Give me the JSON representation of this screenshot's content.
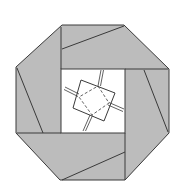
{
  "diagram": {
    "type": "origami-fold-diagram",
    "colors": {
      "paper_fill": "#bcbcbc",
      "line": "#3a3a3a",
      "background": "#ffffff"
    },
    "outline_octagon": [
      [
        62,
        25
      ],
      [
        124,
        25
      ],
      [
        169,
        69
      ],
      [
        169,
        133
      ],
      [
        125,
        180
      ],
      [
        60,
        180
      ],
      [
        16,
        133
      ],
      [
        16,
        67
      ]
    ],
    "inner_window": {
      "x": 61,
      "y": 69,
      "w": 64,
      "h": 64
    },
    "flap_lines": [
      {
        "name": "top-flap-edge",
        "points": [
          [
            61,
            27
          ],
          [
            61,
            69
          ]
        ]
      },
      {
        "name": "top-flap-fold",
        "points": [
          [
            62,
            49
          ],
          [
            124,
            26
          ]
        ]
      },
      {
        "name": "right-flap-edge",
        "points": [
          [
            125,
            69
          ],
          [
            168,
            69
          ]
        ]
      },
      {
        "name": "right-flap-fold",
        "points": [
          [
            144,
            70
          ],
          [
            168,
            132
          ]
        ]
      },
      {
        "name": "bottom-flap-edge",
        "points": [
          [
            125,
            133
          ],
          [
            125,
            180
          ]
        ]
      },
      {
        "name": "bottom-flap-fold",
        "points": [
          [
            62,
            180
          ],
          [
            125,
            152
          ]
        ]
      },
      {
        "name": "left-flap-edge",
        "points": [
          [
            17,
            133
          ],
          [
            61,
            133
          ]
        ]
      },
      {
        "name": "left-flap-fold",
        "points": [
          [
            17,
            68
          ],
          [
            43,
            133
          ]
        ]
      }
    ],
    "center_square_solid": [
      [
        81,
        80
      ],
      [
        115,
        93
      ],
      [
        104,
        121
      ],
      [
        73,
        108
      ]
    ],
    "center_square_dashed": [
      [
        98,
        86
      ],
      [
        109,
        103
      ],
      [
        92,
        115
      ],
      [
        79,
        97
      ]
    ],
    "double_creases": [
      {
        "from": [
          102,
          70
        ],
        "to": [
          99,
          86
        ]
      },
      {
        "from": [
          65,
          88
        ],
        "to": [
          79,
          95
        ]
      },
      {
        "from": [
          123,
          110
        ],
        "to": [
          109,
          104
        ]
      },
      {
        "from": [
          84,
          130
        ],
        "to": [
          91,
          115
        ]
      }
    ]
  }
}
